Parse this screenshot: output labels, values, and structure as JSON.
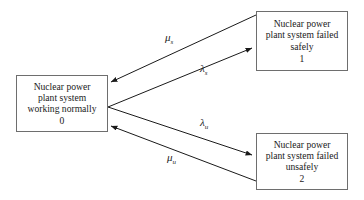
{
  "diagram": {
    "type": "state-transition-diagram",
    "background_color": "#ffffff",
    "box_border_color": "#6e6e6e",
    "text_color": "#1a1a1a",
    "states": [
      {
        "id": "working",
        "line1": "Nuclear power",
        "line2": "plant system",
        "line3": "working normally",
        "number": "0"
      },
      {
        "id": "safe",
        "line1": "Nuclear power",
        "line2": "plant system failed",
        "line3": "safely",
        "number": "1"
      },
      {
        "id": "unsafe",
        "line1": "Nuclear power",
        "line2": "plant system failed",
        "line3": "unsafely",
        "number": "2"
      }
    ],
    "transitions": [
      {
        "id": "mu-s",
        "symbol": "μ",
        "subscript": "s",
        "from": "safe",
        "to": "working"
      },
      {
        "id": "lambda-s",
        "symbol": "λ",
        "subscript": "s",
        "from": "working",
        "to": "safe"
      },
      {
        "id": "lambda-u",
        "symbol": "λ",
        "subscript": "u",
        "from": "working",
        "to": "unsafe"
      },
      {
        "id": "mu-u",
        "symbol": "μ",
        "subscript": "u",
        "from": "unsafe",
        "to": "working"
      }
    ]
  }
}
